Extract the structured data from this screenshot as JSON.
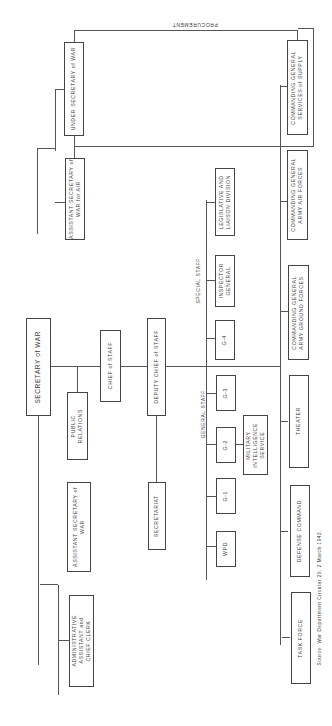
{
  "chart": {
    "title_annotation": "PROCUREMENT",
    "source": "Source: War Department Circular 29, 2 March 1942.",
    "groups": {
      "general_staff": "GENERAL STAFF",
      "special_staff": "SPECIAL STAFF"
    },
    "boxes": {
      "secretary_of_war": "SECRETARY of WAR",
      "under_secretary": "UNDER SECRETARY of WAR",
      "asst_sec_air": "ASSISTANT SECRETARY of\nWAR for AIR",
      "asst_sec_war": "ASSISTANT SECRETARY of\nWAR",
      "admin_asst": "ADMINISTRATIVE\nASSISTANT and\nCHIEF CLERK",
      "public_relations": "PUBLIC\nRELATIONS",
      "chief_of_staff": "CHIEF of STAFF",
      "deputy_chief": "DEPUTY CHIEF of STAFF",
      "secretariat": "SECRETARIAT",
      "g4": "G-4",
      "g3": "G-3",
      "g2": "G-2",
      "g1": "G-1",
      "wpd": "WPD",
      "mis": "MILITARY\nINTELLIGENCE\nSERVICE",
      "inspector_general": "INSPECTOR\nGENERAL",
      "legislative": "LEGISLATIVE AND\nLIAISON DIVISION",
      "cg_sos": "COMMANDING GENERAL\nSERVICES of SUPPLY",
      "cg_aaf": "COMMANDING GENERAL\nARMY AIR FORCES",
      "cg_agf": "COMMANDING GENERAL\nARMY GROUND FORCES",
      "theater": "THEATER",
      "defense_command": "DEFENSE COMMAND",
      "task_force": "TASK FORCE"
    }
  }
}
